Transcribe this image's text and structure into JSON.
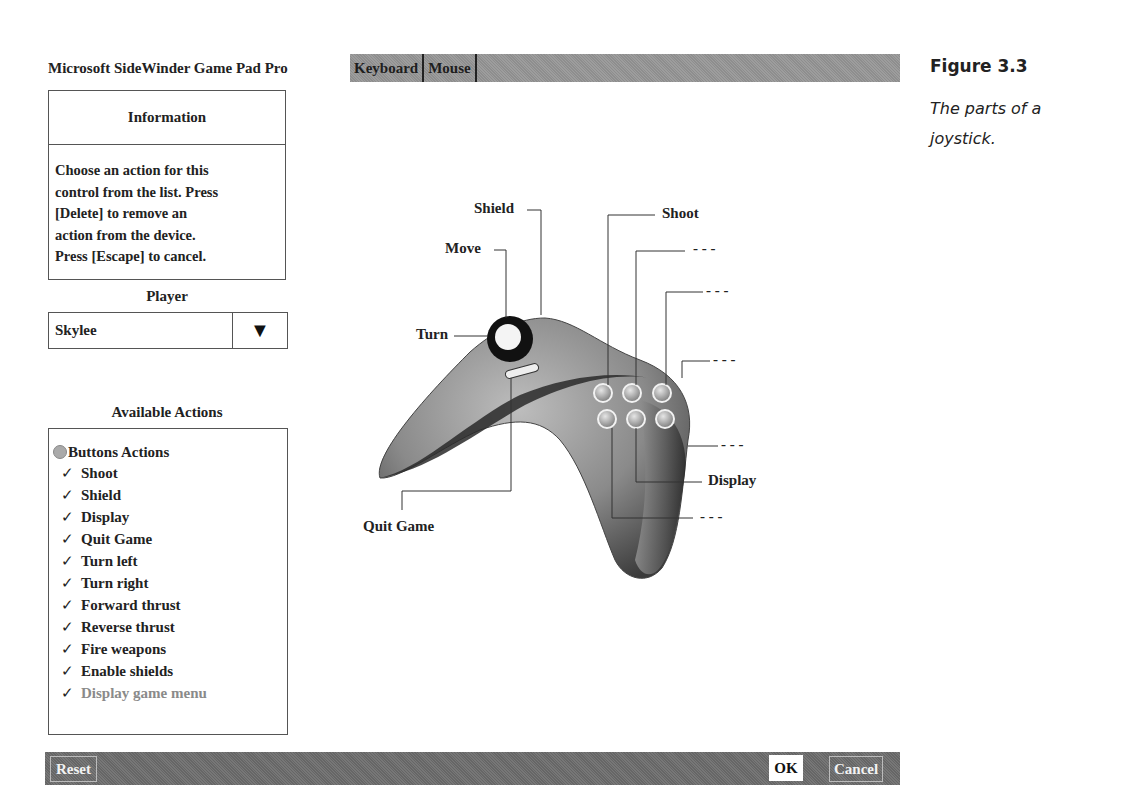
{
  "app": {
    "title": "Microsoft SideWinder Game Pad Pro"
  },
  "tabs": [
    {
      "label": "Keyboard"
    },
    {
      "label": "Mouse"
    }
  ],
  "information": {
    "header": "Information",
    "lines": [
      "Choose an action for this",
      "control from the list. Press",
      "[Delete] to remove an",
      "action from the device.",
      "Press [Escape] to cancel."
    ]
  },
  "player": {
    "label": "Player",
    "selected": "Skylee",
    "dropdown_icon": "triangle-down-icon",
    "dropdown_glyph": "▼"
  },
  "available_actions": {
    "label": "Available Actions",
    "group": "Buttons Actions",
    "check_glyph": "✓",
    "items": [
      {
        "label": "Shoot",
        "assigned": true
      },
      {
        "label": "Shield",
        "assigned": true
      },
      {
        "label": "Display",
        "assigned": true
      },
      {
        "label": "Quit Game",
        "assigned": true
      },
      {
        "label": "Turn left",
        "assigned": true
      },
      {
        "label": "Turn right",
        "assigned": true
      },
      {
        "label": "Forward thrust",
        "assigned": true
      },
      {
        "label": "Reverse thrust",
        "assigned": true
      },
      {
        "label": "Fire weapons",
        "assigned": true
      },
      {
        "label": "Enable shields",
        "assigned": true
      },
      {
        "label": "Display game menu",
        "assigned": false
      }
    ]
  },
  "diagram": {
    "callouts": {
      "shield": "Shield",
      "move": "Move",
      "turn": "Turn",
      "quit_game": "Quit Game",
      "shoot": "Shoot",
      "display": "Display",
      "unassigned": "- - -"
    }
  },
  "buttons": {
    "reset": "Reset",
    "ok": "OK",
    "cancel": "Cancel"
  },
  "figure": {
    "title": "Figure 3.3",
    "caption": "The parts of a joystick."
  },
  "colors": {
    "bar_dark": "#6e6e6e",
    "tab_bar": "#969696",
    "border": "#555555",
    "dim_text": "#8a8a8a"
  }
}
